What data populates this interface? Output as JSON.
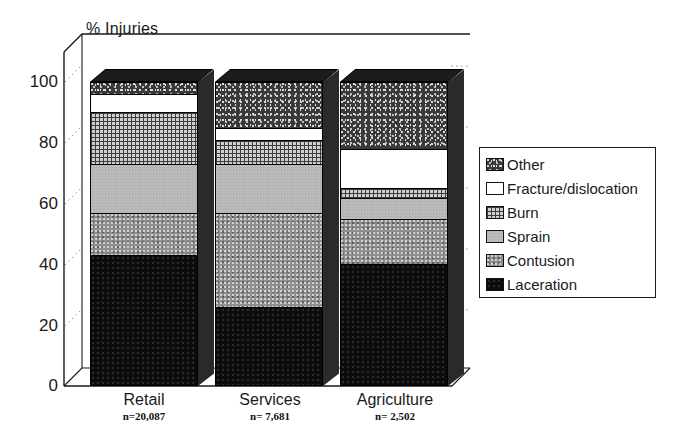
{
  "chart_data": {
    "type": "bar",
    "subtype": "stacked-3d-column",
    "title": "",
    "ylabel": "% Injuries",
    "xlabel": "",
    "ylim": [
      0,
      100
    ],
    "yticks": [
      "0",
      "20",
      "40",
      "60",
      "80",
      "100"
    ],
    "grid": false,
    "legend_position": "right",
    "categories": [
      "Retail",
      "Services",
      "Agriculture"
    ],
    "category_notes": [
      "n=20,087",
      "n= 7,681",
      "n= 2,502"
    ],
    "series": [
      {
        "name": "Laceration",
        "values": [
          43,
          26,
          40
        ]
      },
      {
        "name": "Contusion",
        "values": [
          14,
          31,
          15
        ]
      },
      {
        "name": "Sprain",
        "values": [
          16,
          16,
          7
        ]
      },
      {
        "name": "Burn",
        "values": [
          17,
          8,
          3
        ]
      },
      {
        "name": "Fracture/dislocation",
        "values": [
          6,
          4,
          13
        ]
      },
      {
        "name": "Other",
        "values": [
          4,
          15,
          22
        ]
      }
    ]
  },
  "axis": {
    "title": "% Injuries",
    "ticks": [
      {
        "label": "100",
        "value": 100
      },
      {
        "label": "80",
        "value": 80
      },
      {
        "label": "60",
        "value": 60
      },
      {
        "label": "40",
        "value": 40
      },
      {
        "label": "20",
        "value": 20
      },
      {
        "label": "0",
        "value": 0
      }
    ]
  },
  "categories": [
    {
      "name": "Retail",
      "note": "n=20,087"
    },
    {
      "name": "Services",
      "note": "n= 7,681"
    },
    {
      "name": "Agriculture",
      "note": "n= 2,502"
    }
  ],
  "legend": {
    "items": [
      {
        "label": "Other",
        "pattern": "p-other"
      },
      {
        "label": "Fracture/dislocation",
        "pattern": "p-fracture"
      },
      {
        "label": "Burn",
        "pattern": "p-burn"
      },
      {
        "label": "Sprain",
        "pattern": "p-sprain"
      },
      {
        "label": "Contusion",
        "pattern": "p-contusion"
      },
      {
        "label": "Laceration",
        "pattern": "p-laceration"
      }
    ]
  },
  "colors": {
    "other": "#3a3a3a",
    "fracture": "#ffffff",
    "burn": "#cfcfcf",
    "sprain": "#b4b4b4",
    "contusion": "#8e8e8e",
    "laceration": "#0c0c0c",
    "frame": "#1a1a1a",
    "background": "#ffffff"
  }
}
